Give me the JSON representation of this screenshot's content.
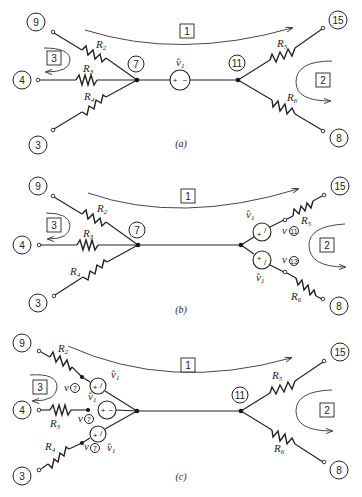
{
  "figure": {
    "panels": [
      {
        "id": "a",
        "caption": "(a)",
        "nodes": [
          "9",
          "4",
          "3",
          "7",
          "11",
          "15",
          "8"
        ],
        "resistors": [
          "R2",
          "R3",
          "R4",
          "R5",
          "R6"
        ],
        "meshes": [
          "1",
          "2",
          "3"
        ],
        "source_label": "v̂1",
        "source_signs": "+ −"
      },
      {
        "id": "b",
        "caption": "(b)",
        "nodes": [
          "9",
          "4",
          "3",
          "7",
          "15",
          "8"
        ],
        "resistors": [
          "R2",
          "R3",
          "R4",
          "R5",
          "R6"
        ],
        "meshes": [
          "1",
          "2",
          "3"
        ],
        "source_label": "v̂1",
        "voltage_labels": [
          "v(11)",
          "v(13)"
        ]
      },
      {
        "id": "c",
        "caption": "(c)",
        "nodes": [
          "9",
          "4",
          "3",
          "11",
          "15",
          "8"
        ],
        "resistors": [
          "R2",
          "R3",
          "R4",
          "R5",
          "R6"
        ],
        "meshes": [
          "1",
          "2",
          "3"
        ],
        "source_label": "v̂1",
        "voltage_labels": [
          "v(7)",
          "v(7)",
          "v(7)"
        ]
      }
    ],
    "labels": {
      "n9": "9",
      "n4": "4",
      "n3": "3",
      "n7": "7",
      "n11": "11",
      "n15": "15",
      "n8": "8",
      "n13": "13",
      "mesh1": "1",
      "mesh2": "2",
      "mesh3": "3",
      "R": "R",
      "s2": "2",
      "s3": "3",
      "s4": "4",
      "s5": "5",
      "s6": "6",
      "v": "v",
      "vhat": "v̂",
      "one": "1",
      "plus": "+",
      "minus": "−",
      "slash": "/",
      "cap_a": "(a)",
      "cap_b": "(b)",
      "cap_c": "(c)"
    }
  }
}
